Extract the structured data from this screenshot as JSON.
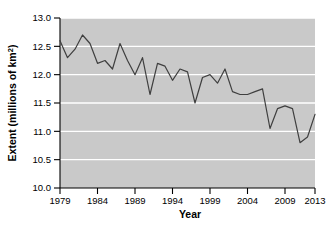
{
  "chart_data": {
    "type": "line",
    "title": "",
    "xlabel": "Year",
    "ylabel": "Extent (millions of km²)",
    "ylabel_base": "Extent (millions of km",
    "ylabel_sup": "2",
    "ylabel_close": ")",
    "xlim": [
      1979,
      2013
    ],
    "ylim": [
      10.0,
      13.0
    ],
    "grid": true,
    "grid_color": "#ffffff",
    "plot_background": "#c9c9c9",
    "line_color": "#3f3f3f",
    "axis_color": "#000000",
    "legend": null,
    "legend_position": "none",
    "x_ticks": [
      1979,
      1984,
      1989,
      1994,
      1999,
      2004,
      2009,
      2013
    ],
    "x_tick_labels": [
      "1979",
      "1984",
      "1989",
      "1994",
      "1999",
      "2004",
      "2009",
      "2013"
    ],
    "y_ticks": [
      10.0,
      10.5,
      11.0,
      11.5,
      12.0,
      12.5,
      13.0
    ],
    "y_tick_labels": [
      "10.0",
      "10.5",
      "11.0",
      "11.5",
      "12.0",
      "12.5",
      "13.0"
    ],
    "x": [
      1979,
      1980,
      1981,
      1982,
      1983,
      1984,
      1985,
      1986,
      1987,
      1988,
      1989,
      1990,
      1991,
      1992,
      1993,
      1994,
      1995,
      1996,
      1997,
      1998,
      1999,
      2000,
      2001,
      2002,
      2003,
      2004,
      2005,
      2006,
      2007,
      2008,
      2009,
      2010,
      2011,
      2012,
      2013
    ],
    "values": [
      12.6,
      12.3,
      12.45,
      12.7,
      12.55,
      12.2,
      12.25,
      12.1,
      12.55,
      12.25,
      12.0,
      12.3,
      11.65,
      12.2,
      12.15,
      11.9,
      12.1,
      12.05,
      11.5,
      11.95,
      12.0,
      11.85,
      12.1,
      11.7,
      11.65,
      11.65,
      11.7,
      11.75,
      11.05,
      11.4,
      11.45,
      11.4,
      10.8,
      10.9,
      11.3
    ],
    "series_name": "Arctic sea ice extent"
  },
  "axes": {
    "y_title_parts": {
      "base": "Extent (millions of km",
      "superscript": "2",
      "close": ")"
    },
    "x_title": "Year"
  }
}
